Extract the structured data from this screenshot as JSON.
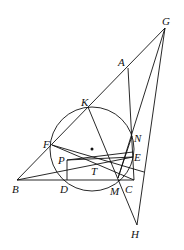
{
  "diagram": {
    "type": "geometry",
    "points": {
      "G": {
        "label": "G",
        "x": 165,
        "y": 28,
        "lx": 164,
        "ly": 22
      },
      "A": {
        "label": "A",
        "x": 128,
        "y": 68,
        "lx": 118,
        "ly": 66
      },
      "K": {
        "label": "K",
        "x": 88,
        "y": 107,
        "lx": 81,
        "ly": 104
      },
      "F": {
        "label": "F",
        "x": 52,
        "y": 145,
        "lx": 43,
        "ly": 148
      },
      "B": {
        "label": "B",
        "x": 17,
        "y": 180,
        "lx": 12,
        "ly": 193
      },
      "D": {
        "label": "D",
        "x": 67,
        "y": 180,
        "lx": 60,
        "ly": 193
      },
      "P": {
        "label": "P",
        "x": 67,
        "y": 160,
        "lx": 58,
        "ly": 164
      },
      "T": {
        "label": "T",
        "x": 95,
        "y": 165,
        "lx": 91,
        "ly": 175
      },
      "M": {
        "label": "M",
        "x": 118,
        "y": 178,
        "lx": 110,
        "ly": 195
      },
      "C": {
        "label": "C",
        "x": 134,
        "y": 180,
        "lx": 125,
        "ly": 193
      },
      "E": {
        "label": "E",
        "x": 133,
        "y": 157,
        "lx": 134,
        "ly": 161
      },
      "N": {
        "label": "N",
        "x": 132,
        "y": 136,
        "lx": 134,
        "ly": 142
      },
      "H": {
        "label": "H",
        "x": 137,
        "y": 225,
        "lx": 131,
        "ly": 238
      },
      "O": {
        "label": "",
        "x": 92,
        "y": 149
      }
    },
    "circle": {
      "cx": 92,
      "cy": 149,
      "r": 42
    },
    "segments": [
      [
        "B",
        "G"
      ],
      [
        "B",
        "C"
      ],
      [
        "B",
        "E"
      ],
      [
        "A",
        "C"
      ],
      [
        "G",
        "H"
      ],
      [
        "G",
        "M"
      ],
      [
        "G",
        "X"
      ],
      [
        "K",
        "C"
      ],
      [
        "F",
        "C"
      ],
      [
        "F",
        "X"
      ],
      [
        "P",
        "E"
      ],
      [
        "P",
        "D"
      ],
      [
        "M",
        "H"
      ],
      [
        "M",
        "N"
      ],
      [
        "F",
        "G"
      ]
    ]
  }
}
